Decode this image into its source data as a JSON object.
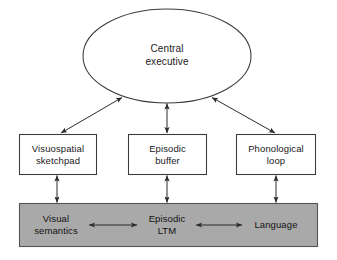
{
  "diagram": {
    "colors": {
      "background": "#ffffff",
      "stroke": "#3a3a3a",
      "box_fill": "#ffffff",
      "gray_band_fill": "#a9a9a9",
      "gray_band_stroke": "#555555",
      "text": "#1a1a1a"
    },
    "nodes": {
      "central_executive": {
        "label": "Central\nexecutive",
        "shape": "ellipse",
        "cx": 167,
        "cy": 56,
        "rx": 84,
        "ry": 47
      },
      "visuospatial_sketchpad": {
        "label": "Visuospatial\nsketchpad",
        "shape": "rect",
        "x": 19,
        "y": 134,
        "w": 78,
        "h": 41
      },
      "episodic_buffer": {
        "label": "Episodic\nbuffer",
        "shape": "rect",
        "x": 128,
        "y": 134,
        "w": 79,
        "h": 41
      },
      "phonological_loop": {
        "label": "Phonological\nloop",
        "shape": "rect",
        "x": 236,
        "y": 134,
        "w": 80,
        "h": 41
      },
      "crystallized_band": {
        "label": "",
        "shape": "rect",
        "x": 19,
        "y": 203,
        "w": 299,
        "h": 44
      },
      "visual_semantics": {
        "label": "Visual\nsemantics",
        "cx": 56,
        "cy": 225
      },
      "episodic_ltm": {
        "label": "Episodic\nLTM",
        "cx": 167,
        "cy": 225
      },
      "language": {
        "label": "Language",
        "cx": 276,
        "cy": 225
      }
    },
    "connectors": [
      {
        "name": "central-executive-to-visuospatial-sketchpad",
        "from": "central_executive",
        "to": "visuospatial_sketchpad",
        "style": "double-headed",
        "orientation": "diagonal"
      },
      {
        "name": "central-executive-to-episodic-buffer",
        "from": "central_executive",
        "to": "episodic_buffer",
        "style": "double-headed",
        "orientation": "vertical"
      },
      {
        "name": "central-executive-to-phonological-loop",
        "from": "central_executive",
        "to": "phonological_loop",
        "style": "double-headed",
        "orientation": "diagonal"
      },
      {
        "name": "visuospatial-sketchpad-to-visual-semantics",
        "from": "visuospatial_sketchpad",
        "to": "visual_semantics",
        "style": "double-headed",
        "orientation": "vertical"
      },
      {
        "name": "episodic-buffer-to-episodic-ltm",
        "from": "episodic_buffer",
        "to": "episodic_ltm",
        "style": "double-headed",
        "orientation": "vertical"
      },
      {
        "name": "phonological-loop-to-language",
        "from": "phonological_loop",
        "to": "language",
        "style": "double-headed",
        "orientation": "vertical"
      },
      {
        "name": "visual-semantics-to-episodic-ltm",
        "from": "visual_semantics",
        "to": "episodic_ltm",
        "style": "double-headed",
        "orientation": "horizontal"
      },
      {
        "name": "episodic-ltm-to-language",
        "from": "episodic_ltm",
        "to": "language",
        "style": "double-headed",
        "orientation": "horizontal"
      }
    ]
  }
}
